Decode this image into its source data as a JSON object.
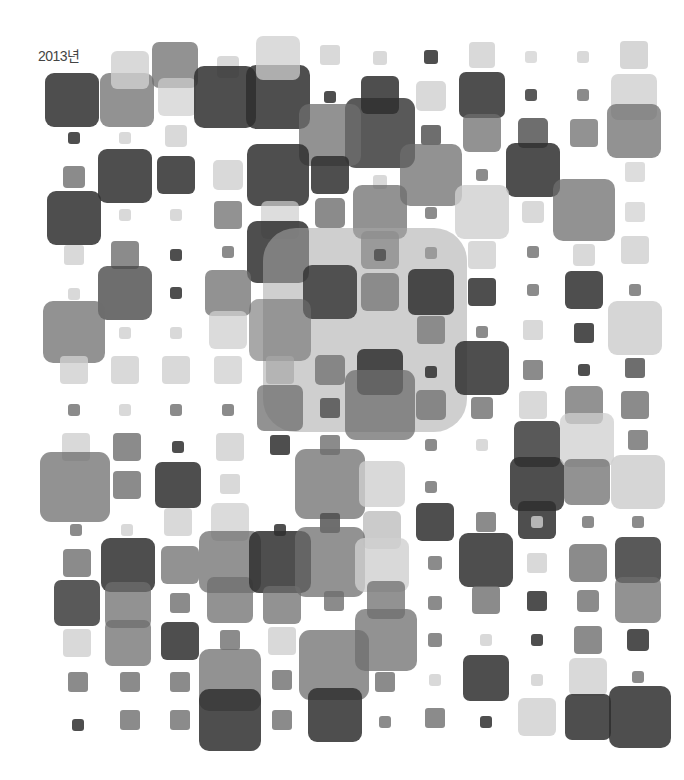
{
  "title": "2013년",
  "palette": {
    "dark": "#2f2f2f",
    "mid_dark": "#4a4a4a",
    "mid": "#6e6e6e",
    "light": "#a8a8a8",
    "pale": "#cfcfcf"
  },
  "squares": [
    {
      "x": 72,
      "y": 100,
      "s": 54,
      "c": "dark",
      "o": 0.85
    },
    {
      "x": 127,
      "y": 100,
      "s": 54,
      "c": "mid",
      "o": 0.75
    },
    {
      "x": 130,
      "y": 70,
      "s": 38,
      "c": "pale",
      "o": 0.8
    },
    {
      "x": 175,
      "y": 65,
      "s": 46,
      "c": "mid",
      "o": 0.75
    },
    {
      "x": 177,
      "y": 97,
      "s": 38,
      "c": "pale",
      "o": 0.7
    },
    {
      "x": 228,
      "y": 67,
      "s": 22,
      "c": "pale",
      "o": 0.8
    },
    {
      "x": 225,
      "y": 97,
      "s": 62,
      "c": "dark",
      "o": 0.85
    },
    {
      "x": 278,
      "y": 97,
      "s": 64,
      "c": "dark",
      "o": 0.85
    },
    {
      "x": 278,
      "y": 58,
      "s": 44,
      "c": "pale",
      "o": 0.75
    },
    {
      "x": 330,
      "y": 55,
      "s": 20,
      "c": "pale",
      "o": 0.8
    },
    {
      "x": 380,
      "y": 58,
      "s": 14,
      "c": "pale",
      "o": 0.8
    },
    {
      "x": 431,
      "y": 57,
      "s": 14,
      "c": "dark",
      "o": 0.85
    },
    {
      "x": 482,
      "y": 55,
      "s": 26,
      "c": "pale",
      "o": 0.8
    },
    {
      "x": 531,
      "y": 57,
      "s": 12,
      "c": "pale",
      "o": 0.7
    },
    {
      "x": 583,
      "y": 57,
      "s": 12,
      "c": "pale",
      "o": 0.8
    },
    {
      "x": 634,
      "y": 55,
      "s": 28,
      "c": "pale",
      "o": 0.85
    },
    {
      "x": 74,
      "y": 138,
      "s": 12,
      "c": "dark",
      "o": 0.85
    },
    {
      "x": 125,
      "y": 138,
      "s": 12,
      "c": "pale",
      "o": 0.8
    },
    {
      "x": 176,
      "y": 136,
      "s": 22,
      "c": "pale",
      "o": 0.8
    },
    {
      "x": 330,
      "y": 97,
      "s": 12,
      "c": "dark",
      "o": 0.85
    },
    {
      "x": 380,
      "y": 95,
      "s": 38,
      "c": "dark",
      "o": 0.85
    },
    {
      "x": 380,
      "y": 133,
      "s": 70,
      "c": "dark",
      "o": 0.8
    },
    {
      "x": 330,
      "y": 135,
      "s": 62,
      "c": "mid",
      "o": 0.75
    },
    {
      "x": 431,
      "y": 135,
      "s": 20,
      "c": "mid_dark",
      "o": 0.8
    },
    {
      "x": 431,
      "y": 96,
      "s": 30,
      "c": "pale",
      "o": 0.8
    },
    {
      "x": 482,
      "y": 95,
      "s": 46,
      "c": "dark",
      "o": 0.85
    },
    {
      "x": 482,
      "y": 133,
      "s": 38,
      "c": "mid",
      "o": 0.75
    },
    {
      "x": 531,
      "y": 95,
      "s": 12,
      "c": "dark",
      "o": 0.8
    },
    {
      "x": 583,
      "y": 95,
      "s": 12,
      "c": "mid",
      "o": 0.8
    },
    {
      "x": 634,
      "y": 97,
      "s": 46,
      "c": "pale",
      "o": 0.8
    },
    {
      "x": 634,
      "y": 131,
      "s": 54,
      "c": "mid",
      "o": 0.75
    },
    {
      "x": 533,
      "y": 133,
      "s": 30,
      "c": "mid_dark",
      "o": 0.8
    },
    {
      "x": 533,
      "y": 170,
      "s": 54,
      "c": "dark",
      "o": 0.85
    },
    {
      "x": 584,
      "y": 133,
      "s": 28,
      "c": "mid",
      "o": 0.75
    },
    {
      "x": 584,
      "y": 210,
      "s": 62,
      "c": "mid",
      "o": 0.75
    },
    {
      "x": 635,
      "y": 172,
      "s": 20,
      "c": "pale",
      "o": 0.7
    },
    {
      "x": 635,
      "y": 212,
      "s": 20,
      "c": "pale",
      "o": 0.7
    },
    {
      "x": 635,
      "y": 250,
      "s": 28,
      "c": "pale",
      "o": 0.8
    },
    {
      "x": 74,
      "y": 177,
      "s": 22,
      "c": "mid",
      "o": 0.8
    },
    {
      "x": 74,
      "y": 218,
      "s": 54,
      "c": "dark",
      "o": 0.85
    },
    {
      "x": 125,
      "y": 176,
      "s": 54,
      "c": "dark",
      "o": 0.85
    },
    {
      "x": 176,
      "y": 175,
      "s": 38,
      "c": "dark",
      "o": 0.85
    },
    {
      "x": 228,
      "y": 175,
      "s": 30,
      "c": "pale",
      "o": 0.8
    },
    {
      "x": 278,
      "y": 175,
      "s": 62,
      "c": "dark",
      "o": 0.85
    },
    {
      "x": 330,
      "y": 175,
      "s": 38,
      "c": "dark",
      "o": 0.85
    },
    {
      "x": 380,
      "y": 182,
      "s": 14,
      "c": "pale",
      "o": 0.8
    },
    {
      "x": 431,
      "y": 175,
      "s": 62,
      "c": "mid",
      "o": 0.75
    },
    {
      "x": 482,
      "y": 175,
      "s": 12,
      "c": "mid",
      "o": 0.8
    },
    {
      "x": 380,
      "y": 212,
      "s": 54,
      "c": "mid",
      "o": 0.75
    },
    {
      "x": 482,
      "y": 212,
      "s": 54,
      "c": "pale",
      "o": 0.8
    },
    {
      "x": 533,
      "y": 212,
      "s": 22,
      "c": "pale",
      "o": 0.8
    },
    {
      "x": 125,
      "y": 215,
      "s": 12,
      "c": "pale",
      "o": 0.8
    },
    {
      "x": 176,
      "y": 215,
      "s": 12,
      "c": "pale",
      "o": 0.8
    },
    {
      "x": 228,
      "y": 215,
      "s": 28,
      "c": "mid",
      "o": 0.75
    },
    {
      "x": 280,
      "y": 220,
      "s": 38,
      "c": "pale",
      "o": 0.7
    },
    {
      "x": 330,
      "y": 213,
      "s": 30,
      "c": "mid",
      "o": 0.8
    },
    {
      "x": 431,
      "y": 213,
      "s": 12,
      "c": "mid",
      "o": 0.8
    },
    {
      "x": 74,
      "y": 255,
      "s": 20,
      "c": "pale",
      "o": 0.8
    },
    {
      "x": 125,
      "y": 255,
      "s": 28,
      "c": "mid",
      "o": 0.8
    },
    {
      "x": 176,
      "y": 255,
      "s": 12,
      "c": "dark",
      "o": 0.85
    },
    {
      "x": 228,
      "y": 252,
      "s": 12,
      "c": "mid",
      "o": 0.8
    },
    {
      "x": 278,
      "y": 252,
      "s": 62,
      "c": "dark",
      "o": 0.85
    },
    {
      "x": 380,
      "y": 250,
      "s": 38,
      "c": "mid",
      "o": 0.8
    },
    {
      "x": 431,
      "y": 253,
      "s": 12,
      "c": "mid",
      "o": 0.8
    },
    {
      "x": 482,
      "y": 255,
      "s": 28,
      "c": "pale",
      "o": 0.8
    },
    {
      "x": 533,
      "y": 252,
      "s": 12,
      "c": "mid",
      "o": 0.8
    },
    {
      "x": 584,
      "y": 255,
      "s": 22,
      "c": "pale",
      "o": 0.8
    },
    {
      "x": 125,
      "y": 293,
      "s": 54,
      "c": "mid_dark",
      "o": 0.8
    },
    {
      "x": 74,
      "y": 294,
      "s": 12,
      "c": "pale",
      "o": 0.8
    },
    {
      "x": 176,
      "y": 293,
      "s": 12,
      "c": "dark",
      "o": 0.85
    },
    {
      "x": 228,
      "y": 293,
      "s": 46,
      "c": "mid",
      "o": 0.75
    },
    {
      "x": 228,
      "y": 330,
      "s": 38,
      "c": "pale",
      "o": 0.75
    },
    {
      "x": 365,
      "y": 330,
      "s": 204,
      "c": "light",
      "o": 0.55
    },
    {
      "x": 330,
      "y": 292,
      "s": 54,
      "c": "dark",
      "o": 0.8
    },
    {
      "x": 380,
      "y": 292,
      "s": 38,
      "c": "mid",
      "o": 0.7
    },
    {
      "x": 431,
      "y": 292,
      "s": 46,
      "c": "dark",
      "o": 0.85
    },
    {
      "x": 280,
      "y": 330,
      "s": 62,
      "c": "mid",
      "o": 0.6
    },
    {
      "x": 380,
      "y": 255,
      "s": 12,
      "c": "mid_dark",
      "o": 0.8
    },
    {
      "x": 482,
      "y": 292,
      "s": 28,
      "c": "dark",
      "o": 0.85
    },
    {
      "x": 533,
      "y": 290,
      "s": 12,
      "c": "mid",
      "o": 0.8
    },
    {
      "x": 584,
      "y": 290,
      "s": 38,
      "c": "dark",
      "o": 0.85
    },
    {
      "x": 635,
      "y": 290,
      "s": 12,
      "c": "mid",
      "o": 0.8
    },
    {
      "x": 635,
      "y": 328,
      "s": 54,
      "c": "pale",
      "o": 0.85
    },
    {
      "x": 74,
      "y": 332,
      "s": 62,
      "c": "mid",
      "o": 0.75
    },
    {
      "x": 125,
      "y": 333,
      "s": 12,
      "c": "pale",
      "o": 0.8
    },
    {
      "x": 176,
      "y": 333,
      "s": 12,
      "c": "pale",
      "o": 0.8
    },
    {
      "x": 431,
      "y": 330,
      "s": 28,
      "c": "mid",
      "o": 0.7
    },
    {
      "x": 482,
      "y": 332,
      "s": 12,
      "c": "mid",
      "o": 0.8
    },
    {
      "x": 533,
      "y": 330,
      "s": 20,
      "c": "pale",
      "o": 0.8
    },
    {
      "x": 584,
      "y": 333,
      "s": 20,
      "c": "dark",
      "o": 0.85
    },
    {
      "x": 74,
      "y": 370,
      "s": 28,
      "c": "pale",
      "o": 0.8
    },
    {
      "x": 125,
      "y": 370,
      "s": 28,
      "c": "pale",
      "o": 0.8
    },
    {
      "x": 176,
      "y": 370,
      "s": 28,
      "c": "pale",
      "o": 0.8
    },
    {
      "x": 228,
      "y": 370,
      "s": 28,
      "c": "pale",
      "o": 0.75
    },
    {
      "x": 280,
      "y": 370,
      "s": 28,
      "c": "light",
      "o": 0.7
    },
    {
      "x": 330,
      "y": 370,
      "s": 30,
      "c": "mid",
      "o": 0.75
    },
    {
      "x": 380,
      "y": 372,
      "s": 46,
      "c": "dark",
      "o": 0.85
    },
    {
      "x": 380,
      "y": 405,
      "s": 70,
      "c": "mid",
      "o": 0.75
    },
    {
      "x": 431,
      "y": 372,
      "s": 12,
      "c": "dark",
      "o": 0.85
    },
    {
      "x": 482,
      "y": 368,
      "s": 54,
      "c": "dark",
      "o": 0.85
    },
    {
      "x": 533,
      "y": 370,
      "s": 20,
      "c": "mid",
      "o": 0.8
    },
    {
      "x": 584,
      "y": 370,
      "s": 12,
      "c": "dark",
      "o": 0.85
    },
    {
      "x": 635,
      "y": 368,
      "s": 20,
      "c": "mid_dark",
      "o": 0.8
    },
    {
      "x": 74,
      "y": 410,
      "s": 12,
      "c": "mid",
      "o": 0.8
    },
    {
      "x": 125,
      "y": 410,
      "s": 12,
      "c": "pale",
      "o": 0.8
    },
    {
      "x": 176,
      "y": 410,
      "s": 12,
      "c": "mid",
      "o": 0.8
    },
    {
      "x": 228,
      "y": 410,
      "s": 12,
      "c": "mid",
      "o": 0.8
    },
    {
      "x": 280,
      "y": 408,
      "s": 46,
      "c": "mid",
      "o": 0.75
    },
    {
      "x": 330,
      "y": 408,
      "s": 20,
      "c": "mid_dark",
      "o": 0.8
    },
    {
      "x": 431,
      "y": 405,
      "s": 30,
      "c": "mid",
      "o": 0.75
    },
    {
      "x": 482,
      "y": 408,
      "s": 22,
      "c": "mid",
      "o": 0.8
    },
    {
      "x": 533,
      "y": 405,
      "s": 28,
      "c": "pale",
      "o": 0.8
    },
    {
      "x": 584,
      "y": 405,
      "s": 38,
      "c": "mid",
      "o": 0.75
    },
    {
      "x": 635,
      "y": 405,
      "s": 28,
      "c": "mid",
      "o": 0.8
    },
    {
      "x": 76,
      "y": 447,
      "s": 28,
      "c": "pale",
      "o": 0.8
    },
    {
      "x": 75,
      "y": 487,
      "s": 70,
      "c": "mid",
      "o": 0.75
    },
    {
      "x": 127,
      "y": 447,
      "s": 28,
      "c": "mid",
      "o": 0.8
    },
    {
      "x": 127,
      "y": 485,
      "s": 28,
      "c": "mid",
      "o": 0.8
    },
    {
      "x": 178,
      "y": 447,
      "s": 12,
      "c": "dark",
      "o": 0.85
    },
    {
      "x": 178,
      "y": 485,
      "s": 46,
      "c": "dark",
      "o": 0.85
    },
    {
      "x": 230,
      "y": 447,
      "s": 28,
      "c": "pale",
      "o": 0.8
    },
    {
      "x": 230,
      "y": 484,
      "s": 20,
      "c": "pale",
      "o": 0.8
    },
    {
      "x": 280,
      "y": 445,
      "s": 20,
      "c": "dark",
      "o": 0.85
    },
    {
      "x": 330,
      "y": 445,
      "s": 20,
      "c": "mid",
      "o": 0.8
    },
    {
      "x": 330,
      "y": 484,
      "s": 70,
      "c": "mid",
      "o": 0.75
    },
    {
      "x": 382,
      "y": 484,
      "s": 46,
      "c": "pale",
      "o": 0.8
    },
    {
      "x": 431,
      "y": 445,
      "s": 12,
      "c": "mid",
      "o": 0.8
    },
    {
      "x": 431,
      "y": 487,
      "s": 12,
      "c": "mid",
      "o": 0.8
    },
    {
      "x": 482,
      "y": 445,
      "s": 12,
      "c": "pale",
      "o": 0.8
    },
    {
      "x": 537,
      "y": 444,
      "s": 46,
      "c": "dark",
      "o": 0.8
    },
    {
      "x": 537,
      "y": 484,
      "s": 54,
      "c": "dark",
      "o": 0.85
    },
    {
      "x": 537,
      "y": 520,
      "s": 38,
      "c": "dark",
      "o": 0.85
    },
    {
      "x": 587,
      "y": 440,
      "s": 54,
      "c": "pale",
      "o": 0.75
    },
    {
      "x": 587,
      "y": 482,
      "s": 46,
      "c": "mid",
      "o": 0.75
    },
    {
      "x": 638,
      "y": 440,
      "s": 20,
      "c": "mid",
      "o": 0.8
    },
    {
      "x": 638,
      "y": 482,
      "s": 54,
      "c": "pale",
      "o": 0.85
    },
    {
      "x": 76,
      "y": 530,
      "s": 12,
      "c": "mid",
      "o": 0.8
    },
    {
      "x": 127,
      "y": 530,
      "s": 12,
      "c": "pale",
      "o": 0.8
    },
    {
      "x": 178,
      "y": 522,
      "s": 28,
      "c": "pale",
      "o": 0.8
    },
    {
      "x": 230,
      "y": 522,
      "s": 38,
      "c": "pale",
      "o": 0.75
    },
    {
      "x": 280,
      "y": 530,
      "s": 12,
      "c": "dark",
      "o": 0.85
    },
    {
      "x": 330,
      "y": 523,
      "s": 20,
      "c": "mid_dark",
      "o": 0.8
    },
    {
      "x": 382,
      "y": 530,
      "s": 38,
      "c": "light",
      "o": 0.6
    },
    {
      "x": 435,
      "y": 522,
      "s": 38,
      "c": "dark",
      "o": 0.85
    },
    {
      "x": 486,
      "y": 522,
      "s": 20,
      "c": "mid",
      "o": 0.8
    },
    {
      "x": 537,
      "y": 522,
      "s": 12,
      "c": "pale",
      "o": 0.8
    },
    {
      "x": 588,
      "y": 522,
      "s": 12,
      "c": "mid",
      "o": 0.8
    },
    {
      "x": 638,
      "y": 522,
      "s": 12,
      "c": "mid",
      "o": 0.8
    },
    {
      "x": 77,
      "y": 563,
      "s": 28,
      "c": "mid",
      "o": 0.8
    },
    {
      "x": 77,
      "y": 603,
      "s": 46,
      "c": "dark",
      "o": 0.8
    },
    {
      "x": 128,
      "y": 565,
      "s": 54,
      "c": "dark",
      "o": 0.85
    },
    {
      "x": 128,
      "y": 605,
      "s": 46,
      "c": "mid",
      "o": 0.75
    },
    {
      "x": 128,
      "y": 643,
      "s": 46,
      "c": "mid",
      "o": 0.75
    },
    {
      "x": 180,
      "y": 565,
      "s": 38,
      "c": "mid",
      "o": 0.75
    },
    {
      "x": 180,
      "y": 603,
      "s": 20,
      "c": "mid",
      "o": 0.8
    },
    {
      "x": 230,
      "y": 562,
      "s": 62,
      "c": "mid",
      "o": 0.75
    },
    {
      "x": 230,
      "y": 600,
      "s": 46,
      "c": "mid",
      "o": 0.75
    },
    {
      "x": 280,
      "y": 562,
      "s": 62,
      "c": "dark",
      "o": 0.85
    },
    {
      "x": 282,
      "y": 605,
      "s": 38,
      "c": "mid",
      "o": 0.75
    },
    {
      "x": 330,
      "y": 562,
      "s": 70,
      "c": "mid",
      "o": 0.75
    },
    {
      "x": 334,
      "y": 601,
      "s": 20,
      "c": "mid",
      "o": 0.8
    },
    {
      "x": 382,
      "y": 565,
      "s": 54,
      "c": "pale",
      "o": 0.8
    },
    {
      "x": 386,
      "y": 600,
      "s": 38,
      "c": "mid",
      "o": 0.75
    },
    {
      "x": 386,
      "y": 640,
      "s": 62,
      "c": "mid",
      "o": 0.75
    },
    {
      "x": 435,
      "y": 563,
      "s": 14,
      "c": "mid",
      "o": 0.8
    },
    {
      "x": 435,
      "y": 603,
      "s": 14,
      "c": "mid",
      "o": 0.8
    },
    {
      "x": 486,
      "y": 560,
      "s": 54,
      "c": "dark",
      "o": 0.85
    },
    {
      "x": 486,
      "y": 600,
      "s": 28,
      "c": "mid",
      "o": 0.8
    },
    {
      "x": 537,
      "y": 563,
      "s": 20,
      "c": "pale",
      "o": 0.8
    },
    {
      "x": 537,
      "y": 601,
      "s": 20,
      "c": "dark",
      "o": 0.85
    },
    {
      "x": 588,
      "y": 563,
      "s": 38,
      "c": "mid",
      "o": 0.8
    },
    {
      "x": 588,
      "y": 601,
      "s": 22,
      "c": "mid",
      "o": 0.8
    },
    {
      "x": 638,
      "y": 560,
      "s": 46,
      "c": "dark",
      "o": 0.8
    },
    {
      "x": 638,
      "y": 600,
      "s": 46,
      "c": "mid",
      "o": 0.75
    },
    {
      "x": 77,
      "y": 643,
      "s": 28,
      "c": "pale",
      "o": 0.8
    },
    {
      "x": 180,
      "y": 641,
      "s": 38,
      "c": "dark",
      "o": 0.85
    },
    {
      "x": 230,
      "y": 640,
      "s": 20,
      "c": "mid",
      "o": 0.8
    },
    {
      "x": 282,
      "y": 641,
      "s": 28,
      "c": "pale",
      "o": 0.8
    },
    {
      "x": 334,
      "y": 665,
      "s": 70,
      "c": "mid",
      "o": 0.75
    },
    {
      "x": 435,
      "y": 640,
      "s": 14,
      "c": "mid",
      "o": 0.8
    },
    {
      "x": 486,
      "y": 640,
      "s": 12,
      "c": "pale",
      "o": 0.8
    },
    {
      "x": 537,
      "y": 640,
      "s": 12,
      "c": "dark",
      "o": 0.85
    },
    {
      "x": 588,
      "y": 640,
      "s": 28,
      "c": "mid",
      "o": 0.8
    },
    {
      "x": 638,
      "y": 640,
      "s": 22,
      "c": "dark",
      "o": 0.85
    },
    {
      "x": 78,
      "y": 682,
      "s": 20,
      "c": "mid",
      "o": 0.8
    },
    {
      "x": 130,
      "y": 682,
      "s": 20,
      "c": "mid",
      "o": 0.8
    },
    {
      "x": 180,
      "y": 682,
      "s": 20,
      "c": "mid",
      "o": 0.8
    },
    {
      "x": 230,
      "y": 680,
      "s": 62,
      "c": "mid",
      "o": 0.75
    },
    {
      "x": 230,
      "y": 720,
      "s": 62,
      "c": "dark",
      "o": 0.85
    },
    {
      "x": 282,
      "y": 680,
      "s": 20,
      "c": "mid",
      "o": 0.8
    },
    {
      "x": 335,
      "y": 715,
      "s": 54,
      "c": "dark",
      "o": 0.85
    },
    {
      "x": 385,
      "y": 682,
      "s": 20,
      "c": "mid",
      "o": 0.8
    },
    {
      "x": 435,
      "y": 680,
      "s": 12,
      "c": "pale",
      "o": 0.8
    },
    {
      "x": 486,
      "y": 678,
      "s": 46,
      "c": "dark",
      "o": 0.85
    },
    {
      "x": 537,
      "y": 680,
      "s": 12,
      "c": "pale",
      "o": 0.8
    },
    {
      "x": 588,
      "y": 677,
      "s": 38,
      "c": "pale",
      "o": 0.8
    },
    {
      "x": 638,
      "y": 677,
      "s": 12,
      "c": "mid",
      "o": 0.8
    },
    {
      "x": 78,
      "y": 725,
      "s": 12,
      "c": "dark",
      "o": 0.85
    },
    {
      "x": 130,
      "y": 720,
      "s": 20,
      "c": "mid",
      "o": 0.8
    },
    {
      "x": 180,
      "y": 720,
      "s": 20,
      "c": "mid",
      "o": 0.8
    },
    {
      "x": 282,
      "y": 720,
      "s": 20,
      "c": "mid",
      "o": 0.8
    },
    {
      "x": 385,
      "y": 722,
      "s": 12,
      "c": "mid",
      "o": 0.8
    },
    {
      "x": 435,
      "y": 718,
      "s": 20,
      "c": "mid",
      "o": 0.8
    },
    {
      "x": 486,
      "y": 722,
      "s": 12,
      "c": "dark",
      "o": 0.85
    },
    {
      "x": 537,
      "y": 717,
      "s": 38,
      "c": "pale",
      "o": 0.8
    },
    {
      "x": 588,
      "y": 717,
      "s": 46,
      "c": "dark",
      "o": 0.85
    },
    {
      "x": 640,
      "y": 717,
      "s": 62,
      "c": "dark",
      "o": 0.85
    }
  ]
}
